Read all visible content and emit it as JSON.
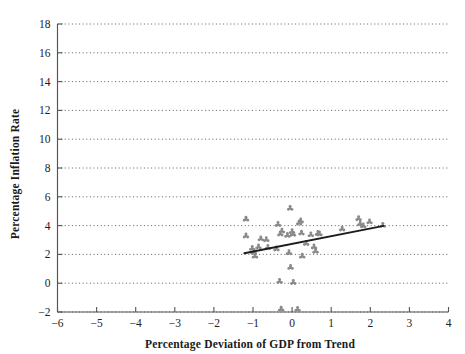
{
  "chart_data": {
    "type": "scatter",
    "title": "",
    "xlabel": "Percentage Deviation of GDP from Trend",
    "ylabel": "Percentage Inflation Rate",
    "xlim": [
      -6,
      4
    ],
    "ylim": [
      -2,
      18
    ],
    "xticks": [
      -6,
      -5,
      -4,
      -3,
      -2,
      -1,
      0,
      1,
      2,
      3,
      4
    ],
    "xtick_labels": [
      "−6",
      "−5",
      "−4",
      "−3",
      "−2",
      "−1",
      "0",
      "1",
      "2",
      "3",
      "4"
    ],
    "yticks": [
      -2,
      0,
      2,
      4,
      6,
      8,
      10,
      12,
      14,
      16,
      18
    ],
    "ytick_labels": [
      "−2",
      "0",
      "2",
      "4",
      "6",
      "8",
      "10",
      "12",
      "14",
      "16",
      "18"
    ],
    "grid": "horizontal-dotted",
    "legend": "none",
    "marker": "asterisk-dot",
    "marker_color": "#8a8a8a",
    "points": [
      {
        "x": -1.18,
        "y": 4.45
      },
      {
        "x": -1.18,
        "y": 3.28
      },
      {
        "x": -1.02,
        "y": 2.42
      },
      {
        "x": -0.98,
        "y": 2.15
      },
      {
        "x": -0.95,
        "y": 1.88
      },
      {
        "x": -0.86,
        "y": 2.52
      },
      {
        "x": -0.8,
        "y": 3.08
      },
      {
        "x": -0.66,
        "y": 3.02
      },
      {
        "x": -0.62,
        "y": 2.48
      },
      {
        "x": -0.4,
        "y": 2.38
      },
      {
        "x": -0.36,
        "y": 4.08
      },
      {
        "x": -0.32,
        "y": 0.12
      },
      {
        "x": -0.3,
        "y": 3.42
      },
      {
        "x": -0.26,
        "y": 3.62
      },
      {
        "x": -0.28,
        "y": -1.8
      },
      {
        "x": -0.12,
        "y": 3.32
      },
      {
        "x": -0.08,
        "y": 2.12
      },
      {
        "x": -0.05,
        "y": 5.2
      },
      {
        "x": -0.04,
        "y": 1.1
      },
      {
        "x": 0.0,
        "y": 3.58
      },
      {
        "x": 0.02,
        "y": 3.4
      },
      {
        "x": 0.03,
        "y": 0.05
      },
      {
        "x": 0.14,
        "y": -1.82
      },
      {
        "x": 0.18,
        "y": 4.18
      },
      {
        "x": 0.22,
        "y": 4.32
      },
      {
        "x": 0.24,
        "y": 3.48
      },
      {
        "x": 0.26,
        "y": 1.88
      },
      {
        "x": 0.36,
        "y": 2.76
      },
      {
        "x": 0.48,
        "y": 3.36
      },
      {
        "x": 0.56,
        "y": 2.52
      },
      {
        "x": 0.6,
        "y": 2.22
      },
      {
        "x": 0.66,
        "y": 3.46
      },
      {
        "x": 0.7,
        "y": 3.42
      },
      {
        "x": 1.28,
        "y": 3.76
      },
      {
        "x": 1.7,
        "y": 4.48
      },
      {
        "x": 1.74,
        "y": 4.12
      },
      {
        "x": 1.82,
        "y": 3.98
      },
      {
        "x": 1.98,
        "y": 4.26
      },
      {
        "x": 2.32,
        "y": 4.02
      }
    ],
    "trend_line": {
      "x_start": -1.22,
      "y_start": 2.08,
      "x_end": 2.34,
      "y_end": 3.98,
      "color": "#1c1c1c"
    }
  }
}
